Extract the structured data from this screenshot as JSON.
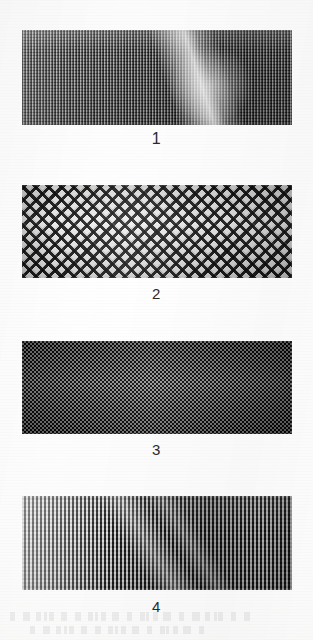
{
  "figure": {
    "type": "photographic-plate",
    "rendering": "grayscale halftone scan",
    "background_color": "#f7f7f6",
    "specimen_count": 4
  },
  "specimens": [
    {
      "label": "1",
      "name": "specimen-1",
      "weave": "fine vertical rib weave",
      "tone": "medium gray",
      "feature": "bright diagonal highlight streak right of centre",
      "base_color": "#6b6b6b"
    },
    {
      "label": "2",
      "name": "specimen-2",
      "weave": "coarse diagonal lattice mesh",
      "tone": "high contrast black on white",
      "feature": "open diamond net with crossing cords",
      "base_color": "#efefee"
    },
    {
      "label": "3",
      "name": "specimen-3",
      "weave": "dense plain basket weave",
      "tone": "very dark",
      "feature": "tight uniform checkerboard of small floats",
      "base_color": "#262626"
    },
    {
      "label": "4",
      "name": "specimen-4",
      "weave": "vertical rib weave",
      "tone": "graded light to dark",
      "feature": "left-to-right luminance gradient with faint diagonal sheen",
      "base_color": "#8d8d8d"
    }
  ]
}
